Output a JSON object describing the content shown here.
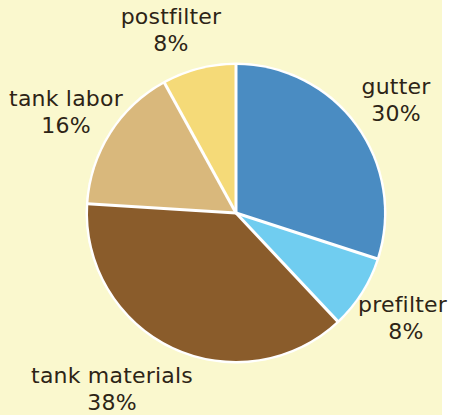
{
  "chart_data": {
    "type": "pie",
    "title": "",
    "subtitle": "",
    "xlabel": "",
    "ylabel": "",
    "legend_position": "none",
    "grid": false,
    "units": "percent",
    "total": 100,
    "start_angle_deg": 0,
    "direction": "clockwise",
    "background_color": "#faf8ce",
    "separator_color": "#ffffff",
    "label_color": "#2d2416",
    "categories": [
      "gutter",
      "prefilter",
      "tank materials",
      "tank labor",
      "postfilter"
    ],
    "values": [
      30,
      8,
      38,
      16,
      8
    ],
    "colors": [
      "#4a8cc2",
      "#70cdf0",
      "#8a5c2b",
      "#d9b87c",
      "#f5da78"
    ],
    "slices": [
      {
        "name": "gutter",
        "value": 30,
        "value_label": "30%",
        "color": "#4a8cc2",
        "start_deg": 0,
        "end_deg": 108,
        "label_position": "right"
      },
      {
        "name": "prefilter",
        "value": 8,
        "value_label": "8%",
        "color": "#70cdf0",
        "start_deg": 108,
        "end_deg": 136.8,
        "label_position": "bottom-right"
      },
      {
        "name": "tank materials",
        "value": 38,
        "value_label": "38%",
        "color": "#8a5c2b",
        "start_deg": 136.8,
        "end_deg": 273.6,
        "label_position": "bottom-left"
      },
      {
        "name": "tank labor",
        "value": 16,
        "value_label": "16%",
        "color": "#d9b87c",
        "start_deg": 273.6,
        "end_deg": 331.2,
        "label_position": "left"
      },
      {
        "name": "postfilter",
        "value": 8,
        "value_label": "8%",
        "color": "#f5da78",
        "start_deg": 331.2,
        "end_deg": 360,
        "label_position": "top"
      }
    ],
    "geometry": {
      "center_x": 236,
      "center_y": 213,
      "radius": 148
    }
  }
}
